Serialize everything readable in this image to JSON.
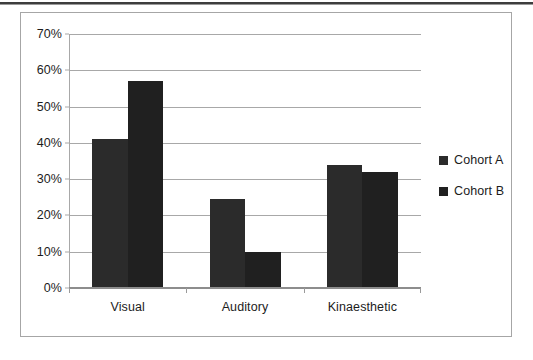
{
  "chart_data": {
    "type": "bar",
    "title": "",
    "subtitle": "",
    "xlabel": "",
    "ylabel": "",
    "categories": [
      "Visual",
      "Auditory",
      "Kinaesthetic"
    ],
    "series": [
      {
        "name": "Cohort A",
        "color": "#2b2b2b",
        "values": [
          41,
          24.5,
          34
        ]
      },
      {
        "name": "Cohort B",
        "color": "#202020",
        "values": [
          57,
          10,
          32
        ]
      }
    ],
    "ylim": [
      0,
      70
    ],
    "ytick_step": 10,
    "ytick_labels": [
      "0%",
      "10%",
      "20%",
      "30%",
      "40%",
      "50%",
      "60%",
      "70%"
    ],
    "ytick_values": [
      0,
      10,
      20,
      30,
      40,
      50,
      60,
      70
    ],
    "grid": true,
    "grid_axis": "y",
    "legend_position": "right",
    "value_format": "percent"
  },
  "legend": {
    "entries": [
      {
        "label": "Cohort A",
        "marker": "square-marker"
      },
      {
        "label": "Cohort B",
        "marker": "square-marker"
      }
    ]
  },
  "colors": {
    "series_a": "#2b2b2b",
    "series_b": "#202020",
    "gridline": "#a8a8a8",
    "frame": "#a6a6a6",
    "text": "#1c1c1c",
    "page_rule": "#3d3d3d"
  }
}
